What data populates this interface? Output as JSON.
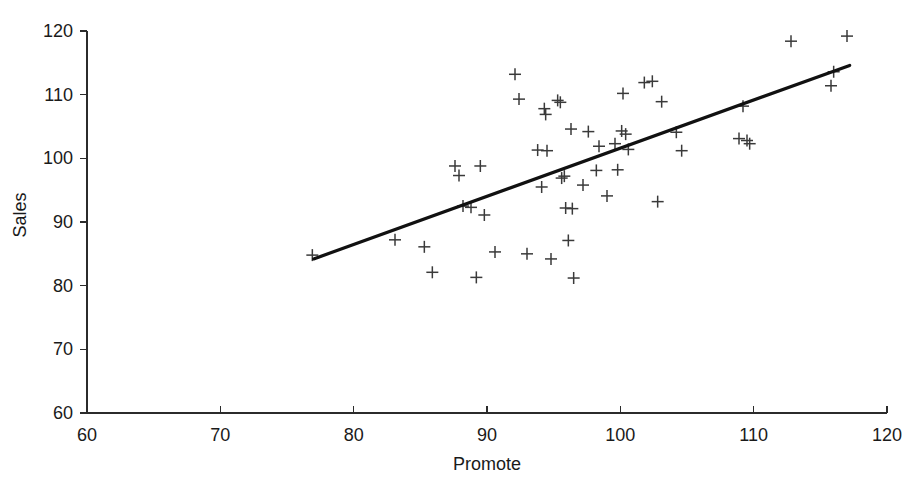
{
  "chart_data": {
    "type": "scatter",
    "title": "",
    "xlabel": "Promote",
    "ylabel": "Sales",
    "xlim": [
      60,
      120
    ],
    "ylim": [
      60,
      120
    ],
    "xticks": [
      60,
      70,
      80,
      90,
      100,
      110,
      120
    ],
    "yticks": [
      60,
      70,
      80,
      90,
      100,
      110,
      120
    ],
    "grid": false,
    "legend": null,
    "marker": "plus",
    "marker_color": "#3a3a3a",
    "line_color": "#111111",
    "background_color": "#ffffff",
    "axis_color": "#2b2b2b",
    "series": [
      {
        "name": "Sales vs Promote",
        "type": "scatter",
        "points": [
          [
            76.9,
            84.8
          ],
          [
            83.1,
            87.2
          ],
          [
            85.3,
            86.1
          ],
          [
            85.9,
            82.1
          ],
          [
            87.6,
            98.8
          ],
          [
            87.9,
            97.3
          ],
          [
            88.2,
            92.5
          ],
          [
            88.8,
            92.3
          ],
          [
            89.2,
            81.3
          ],
          [
            89.5,
            98.8
          ],
          [
            89.8,
            91.1
          ],
          [
            90.6,
            85.3
          ],
          [
            92.1,
            113.2
          ],
          [
            92.4,
            109.3
          ],
          [
            93.0,
            85.0
          ],
          [
            93.8,
            101.3
          ],
          [
            94.1,
            95.5
          ],
          [
            94.3,
            107.8
          ],
          [
            94.4,
            106.9
          ],
          [
            94.5,
            101.2
          ],
          [
            94.8,
            84.2
          ],
          [
            95.3,
            109.1
          ],
          [
            95.5,
            108.8
          ],
          [
            95.6,
            96.9
          ],
          [
            95.8,
            97.2
          ],
          [
            95.9,
            92.2
          ],
          [
            96.1,
            87.1
          ],
          [
            96.3,
            104.6
          ],
          [
            96.4,
            92.1
          ],
          [
            96.5,
            81.2
          ],
          [
            97.2,
            95.8
          ],
          [
            97.6,
            104.2
          ],
          [
            98.2,
            98.1
          ],
          [
            98.4,
            101.9
          ],
          [
            99.0,
            94.1
          ],
          [
            99.6,
            102.3
          ],
          [
            99.8,
            98.2
          ],
          [
            100.1,
            104.3
          ],
          [
            100.2,
            110.2
          ],
          [
            100.4,
            103.8
          ],
          [
            100.6,
            101.4
          ],
          [
            101.8,
            111.9
          ],
          [
            102.4,
            112.1
          ],
          [
            102.8,
            93.2
          ],
          [
            103.1,
            108.9
          ],
          [
            104.2,
            104.1
          ],
          [
            104.6,
            101.2
          ],
          [
            108.9,
            103.1
          ],
          [
            109.2,
            108.2
          ],
          [
            109.5,
            102.8
          ],
          [
            109.7,
            102.3
          ],
          [
            112.8,
            118.4
          ],
          [
            115.8,
            111.4
          ],
          [
            116.0,
            113.6
          ],
          [
            117.0,
            119.2
          ]
        ]
      }
    ],
    "trend_line": {
      "name": "fitted regression line",
      "type": "line",
      "x_start": 77.0,
      "y_start": 84.2,
      "x_end": 117.2,
      "y_end": 114.6
    }
  }
}
